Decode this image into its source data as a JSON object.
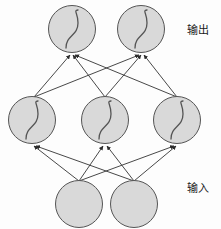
{
  "diagram": {
    "type": "neural-network",
    "title": "",
    "background_color": "#fdfdfd",
    "node_fill_color": "#d9d9d9",
    "node_stroke_color": "#555555",
    "edge_color": "#333333",
    "curve_color": "#555555",
    "labels": {
      "output": "输出",
      "input": "输入"
    },
    "layers": [
      {
        "id": "output-layer",
        "name": "output",
        "label": "输出",
        "activation": "sigmoid",
        "has_activation_curve": true,
        "node_radius": 24,
        "center_y": 29,
        "nodes": [
          {
            "id": "out-1",
            "cx": 72,
            "cy": 29
          },
          {
            "id": "out-2",
            "cx": 141,
            "cy": 29
          }
        ]
      },
      {
        "id": "hidden-layer",
        "name": "hidden",
        "label": "",
        "activation": "sigmoid",
        "has_activation_curve": true,
        "node_radius": 24,
        "center_y": 120,
        "nodes": [
          {
            "id": "hid-1",
            "cx": 32,
            "cy": 120
          },
          {
            "id": "hid-2",
            "cx": 105,
            "cy": 120
          },
          {
            "id": "hid-3",
            "cx": 177,
            "cy": 120
          }
        ]
      },
      {
        "id": "input-layer",
        "name": "input",
        "label": "输入",
        "activation": "none",
        "has_activation_curve": false,
        "node_radius": 24,
        "center_y": 204,
        "nodes": [
          {
            "id": "in-1",
            "cx": 79,
            "cy": 204
          },
          {
            "id": "in-2",
            "cx": 134,
            "cy": 204
          }
        ]
      }
    ],
    "edges": [
      {
        "from": "in-1",
        "to": "hid-1"
      },
      {
        "from": "in-1",
        "to": "hid-2"
      },
      {
        "from": "in-1",
        "to": "hid-3"
      },
      {
        "from": "in-2",
        "to": "hid-1"
      },
      {
        "from": "in-2",
        "to": "hid-2"
      },
      {
        "from": "in-2",
        "to": "hid-3"
      },
      {
        "from": "hid-1",
        "to": "out-1"
      },
      {
        "from": "hid-1",
        "to": "out-2"
      },
      {
        "from": "hid-2",
        "to": "out-1"
      },
      {
        "from": "hid-2",
        "to": "out-2"
      },
      {
        "from": "hid-3",
        "to": "out-1"
      },
      {
        "from": "hid-3",
        "to": "out-2"
      }
    ],
    "edge_direction": "bottom-to-top",
    "arrowheads": true
  }
}
